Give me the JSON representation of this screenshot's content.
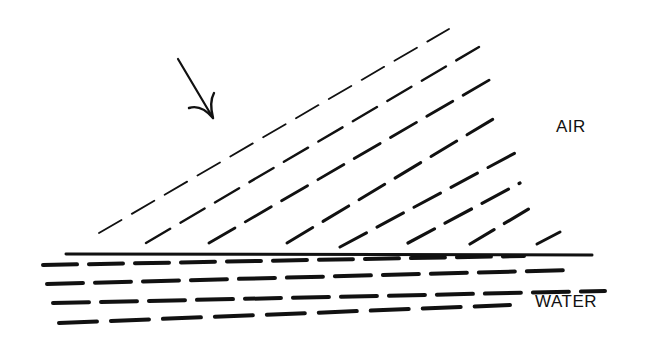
{
  "diagram": {
    "ink_color": "#111111",
    "background": "#ffffff"
  },
  "labels": {
    "air": "AIR",
    "water": "WATER"
  },
  "arrow": {
    "semantic": "incident-direction-arrow",
    "from": [
      178,
      59
    ],
    "to": [
      213,
      118
    ]
  },
  "interface": {
    "semantic": "air-water-boundary",
    "from": [
      66,
      254
    ],
    "to": [
      592,
      255
    ],
    "stroke_width": 3
  },
  "air_wavefronts": [
    {
      "from": [
        99,
        233
      ],
      "to": [
        449,
        29
      ],
      "width": 1.8,
      "dash": "26 12"
    },
    {
      "from": [
        146,
        243
      ],
      "to": [
        479,
        47
      ],
      "width": 2.4,
      "dash": "28 12"
    },
    {
      "from": [
        209,
        243
      ],
      "to": [
        491,
        79
      ],
      "width": 2.8,
      "dash": "30 12"
    },
    {
      "from": [
        287,
        243
      ],
      "to": [
        500,
        115
      ],
      "width": 3.0,
      "dash": "30 12"
    },
    {
      "from": [
        340,
        247
      ],
      "to": [
        515,
        153
      ],
      "width": 3.0,
      "dash": "30 12"
    },
    {
      "from": [
        408,
        243
      ],
      "to": [
        520,
        183
      ],
      "width": 3.2,
      "dash": "30 12"
    },
    {
      "from": [
        470,
        244
      ],
      "to": [
        537,
        204
      ],
      "width": 3.2,
      "dash": "28 12"
    },
    {
      "from": [
        537,
        244
      ],
      "to": [
        560,
        232
      ],
      "width": 3.0,
      "dash": "26 10"
    }
  ],
  "water_wavefronts": [
    {
      "from": [
        43,
        265
      ],
      "to": [
        524,
        256
      ],
      "width": 4.0,
      "dash": "34 12"
    },
    {
      "from": [
        47,
        284
      ],
      "to": [
        571,
        270
      ],
      "width": 4.0,
      "dash": "36 12"
    },
    {
      "from": [
        53,
        303
      ],
      "to": [
        605,
        291
      ],
      "width": 4.0,
      "dash": "36 12"
    },
    {
      "from": [
        59,
        323
      ],
      "to": [
        510,
        305
      ],
      "width": 4.0,
      "dash": "38 14"
    }
  ]
}
